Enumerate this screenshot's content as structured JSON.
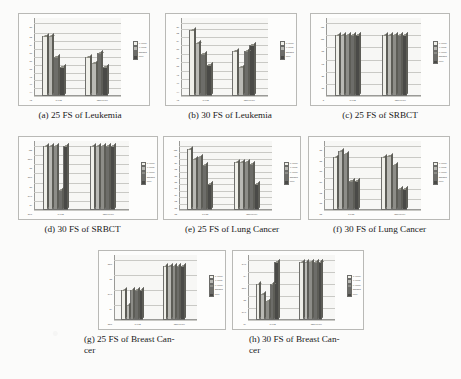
{
  "figure": {
    "palette": {
      "p_value": "#efefe9",
      "t_value": "#b9b9b4",
      "f_value": "#8d8d88",
      "mrmr": "#6d6d69",
      "pso": "#4a4a47",
      "axis": "#9a9a97",
      "grid": "#c9c9c5",
      "wall": "#f7f7f5",
      "frame": "#b9b9b6",
      "page": "#fbfbfa",
      "text": "#1a1a1a"
    },
    "legend_labels_5": [
      "P-value",
      "T-value",
      "F-value",
      "MRMR",
      "PSO"
    ],
    "legend_labels_4": [
      "P-value",
      "T-value",
      "MRMR",
      "PSO"
    ],
    "classifiers": [
      "SVM",
      "BayesNet"
    ]
  },
  "charts": [
    {
      "id": "a",
      "caption": "(a) 25 FS of Leukemia",
      "chart_data": {
        "type": "bar",
        "title": "25 FS of Leukemia",
        "xlabel": "",
        "ylabel": "",
        "ylim": [
          70,
          98
        ],
        "yticks": [
          70,
          73,
          76,
          79,
          82,
          85,
          88,
          91,
          94,
          98
        ],
        "categories": [
          "SVM",
          "BayesNet"
        ],
        "legend_position": "right",
        "grid": true,
        "series": [
          {
            "name": "P-value",
            "values": [
              93.0,
              85.0
            ]
          },
          {
            "name": "T-value",
            "values": [
              93.2,
              82.5
            ]
          },
          {
            "name": "MRMR",
            "values": [
              85.0,
              86.5
            ]
          },
          {
            "name": "PSO",
            "values": [
              81.0,
              81.0
            ]
          }
        ]
      }
    },
    {
      "id": "b",
      "caption": "(b) 30 FS of Leukemia",
      "chart_data": {
        "type": "bar",
        "title": "30 FS of Leukemia",
        "xlabel": "",
        "ylabel": "",
        "ylim": [
          70,
          96
        ],
        "yticks": [
          70,
          73,
          76,
          79,
          82,
          85,
          88,
          91,
          94,
          96
        ],
        "categories": [
          "SVM",
          "BayesNet"
        ],
        "legend_position": "right",
        "grid": true,
        "series": [
          {
            "name": "P-value",
            "values": [
              93.5,
              86.0
            ]
          },
          {
            "name": "T-value",
            "values": [
              89.0,
              80.5
            ]
          },
          {
            "name": "MRMR",
            "values": [
              85.0,
              86.0
            ]
          },
          {
            "name": "PSO",
            "values": [
              81.0,
              88.0
            ]
          }
        ]
      }
    },
    {
      "id": "c",
      "caption": "(c) 25 FS of SRBCT",
      "chart_data": {
        "type": "bar",
        "title": "25 FS of SRBCT",
        "xlabel": "",
        "ylabel": "",
        "ylim": [
          0,
          120
        ],
        "yticks": [
          0,
          20,
          40,
          60,
          80,
          100,
          120
        ],
        "categories": [
          "SVM",
          "BayesNet"
        ],
        "legend_position": "right",
        "grid": true,
        "series": [
          {
            "name": "P-value",
            "values": [
              100,
              100
            ]
          },
          {
            "name": "T-value",
            "values": [
              100,
              100
            ]
          },
          {
            "name": "F-value",
            "values": [
              100,
              100
            ]
          },
          {
            "name": "MRMR",
            "values": [
              100,
              100
            ]
          },
          {
            "name": "PSO",
            "values": [
              100,
              100
            ]
          }
        ]
      }
    },
    {
      "id": "d",
      "caption": "(d) 30 FS of SRBCT",
      "chart_data": {
        "type": "bar",
        "title": "30 FS of SRBCT",
        "xlabel": "",
        "ylabel": "",
        "ylim": [
          96.5,
          100
        ],
        "yticks": [
          100,
          99.5,
          99,
          98.5,
          98,
          97.5,
          97,
          96.5
        ],
        "categories": [
          "SVM",
          "BayesNet"
        ],
        "legend_position": "right",
        "grid": true,
        "series": [
          {
            "name": "P-value",
            "values": [
              100,
              100
            ]
          },
          {
            "name": "T-value",
            "values": [
              100,
              100
            ]
          },
          {
            "name": "F-value",
            "values": [
              100,
              100
            ]
          },
          {
            "name": "MRMR",
            "values": [
              97.6,
              100
            ]
          },
          {
            "name": "PSO",
            "values": [
              100,
              100
            ]
          }
        ]
      }
    },
    {
      "id": "e",
      "caption": "(e) 25 FS of Lung Cancer",
      "chart_data": {
        "type": "bar",
        "title": "25 FS of Lung Cancer",
        "xlabel": "",
        "ylabel": "",
        "ylim": [
          80,
          100
        ],
        "yticks": [
          80,
          82,
          84,
          86,
          88,
          90,
          92,
          94,
          96,
          98,
          100
        ],
        "categories": [
          "SVM",
          "BayesNet"
        ],
        "legend_position": "right",
        "grid": true,
        "series": [
          {
            "name": "P-value",
            "values": [
              99.0,
              95.0
            ]
          },
          {
            "name": "T-value",
            "values": [
              96.0,
              95.0
            ]
          },
          {
            "name": "F-value",
            "values": [
              96.5,
              95.0
            ]
          },
          {
            "name": "MRMR",
            "values": [
              94.0,
              94.5
            ]
          },
          {
            "name": "PSO",
            "values": [
              88.0,
              88.0
            ]
          }
        ]
      }
    },
    {
      "id": "f",
      "caption": "(f) 30 FS of Lung Cancer",
      "chart_data": {
        "type": "bar",
        "title": "30 FS of Lung Cancer",
        "xlabel": "",
        "ylabel": "",
        "ylim": [
          80,
          92
        ],
        "yticks": [
          80,
          82,
          84,
          86,
          88,
          90,
          92
        ],
        "categories": [
          "SVM",
          "BayesNet"
        ],
        "legend_position": "right",
        "grid": true,
        "series": [
          {
            "name": "P-value",
            "values": [
              90.0,
              90.0
            ]
          },
          {
            "name": "T-value",
            "values": [
              91.0,
              90.2
            ]
          },
          {
            "name": "F-value",
            "values": [
              90.5,
              88.5
            ]
          },
          {
            "name": "MRMR",
            "values": [
              85.5,
              84.0
            ]
          },
          {
            "name": "PSO",
            "values": [
              85.5,
              84.0
            ]
          }
        ]
      }
    },
    {
      "id": "g",
      "caption": "(g) 25 FS of Breast Can-cer",
      "chart_data": {
        "type": "bar",
        "title": "25 FS of Breast Cancer",
        "xlabel": "",
        "ylabel": "",
        "ylim": [
          90.5,
          92.5
        ],
        "yticks": [
          92.5,
          92,
          91.5,
          91,
          90.5
        ],
        "categories": [
          "SVM",
          "BayesNet"
        ],
        "legend_position": "right",
        "grid": true,
        "series": [
          {
            "name": "P-value",
            "values": [
              91.5,
              92.3
            ]
          },
          {
            "name": "T-value",
            "values": [
              91.0,
              92.3
            ]
          },
          {
            "name": "F-value",
            "values": [
              91.5,
              92.3
            ]
          },
          {
            "name": "MRMR",
            "values": [
              91.5,
              92.3
            ]
          },
          {
            "name": "PSO",
            "values": [
              91.5,
              92.3
            ]
          }
        ]
      }
    },
    {
      "id": "h",
      "caption": "(h) 30 FS of Breast Can-cer",
      "chart_data": {
        "type": "bar",
        "title": "30 FS of Breast Cancer",
        "xlabel": "",
        "ylabel": "",
        "ylim": [
          91,
          93.5
        ],
        "yticks": [
          93.5,
          93,
          92.5,
          92,
          91.5,
          91
        ],
        "categories": [
          "SVM",
          "BayesNet"
        ],
        "legend_position": "right",
        "grid": true,
        "series": [
          {
            "name": "P-value",
            "values": [
              92.5,
              93.4
            ]
          },
          {
            "name": "T-value",
            "values": [
              92.1,
              93.4
            ]
          },
          {
            "name": "F-value",
            "values": [
              91.8,
              93.4
            ]
          },
          {
            "name": "MRMR",
            "values": [
              92.5,
              93.4
            ]
          },
          {
            "name": "PSO",
            "values": [
              93.4,
              93.4
            ]
          }
        ]
      }
    }
  ],
  "captions": {
    "a": "(a) 25 FS of Leukemia",
    "b": "(b) 30 FS of Leukemia",
    "c": "(c) 25 FS of SRBCT",
    "d": "(d) 30 FS of SRBCT",
    "e": "(e) 25 FS of Lung Cancer",
    "f": "(f) 30 FS of Lung Cancer",
    "g_line1": "(g) 25 FS of Breast Can-",
    "g_line2": "cer",
    "h_line1": "(h) 30 FS of Breast Can-",
    "h_line2": "cer"
  }
}
